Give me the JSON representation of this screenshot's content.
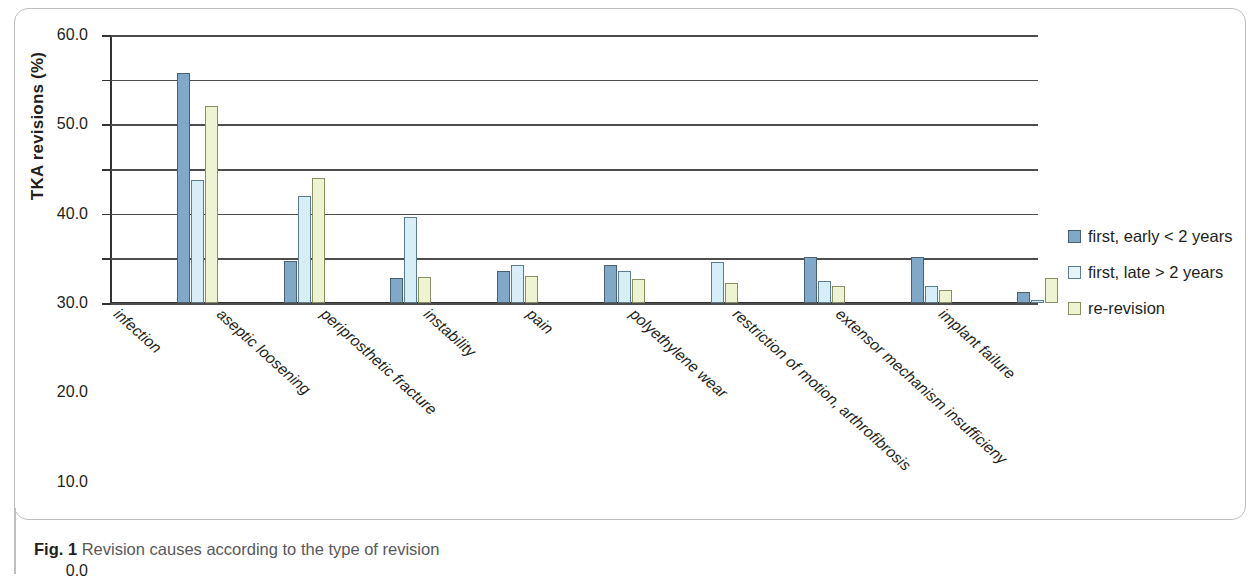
{
  "figure": {
    "caption_label": "Fig. 1",
    "caption_text": " Revision causes according to the type of revision"
  },
  "legend": {
    "position": "right",
    "items": [
      {
        "label": "first, early < 2 years",
        "color": "#7fa8c9",
        "swatch": "series-0-swatch"
      },
      {
        "label": "first, late > 2 years",
        "color": "#e6f4fa",
        "swatch": "series-1-swatch"
      },
      {
        "label": "re-revision",
        "color": "#eef3d2",
        "swatch": "series-2-swatch"
      }
    ]
  },
  "axes": {
    "y_title": "TKA revisions (%)",
    "y_ticks": [
      "60.0",
      "50.0",
      "40.0",
      "30.0",
      "20.0",
      "10.0",
      "0.0"
    ],
    "x_title": ""
  },
  "chart_data": {
    "type": "bar",
    "title": "",
    "subtitle": "",
    "xlabel": "",
    "ylabel": "TKA revisions (%)",
    "ylim": [
      0,
      60
    ],
    "ytick_values": [
      0,
      10,
      20,
      30,
      40,
      50,
      60
    ],
    "grid": true,
    "legend_position": "right",
    "categories": [
      "infection",
      "aseptic loosening",
      "periprosthetic fracture",
      "instability",
      "pain",
      "polyethylene wear",
      "restriction of motion, arthrofibrosis",
      "extensor mechanism insufficieny",
      "implant failure"
    ],
    "series": [
      {
        "name": "first, early < 2 years",
        "color": "#7fa8c9",
        "values": [
          51.5,
          9.5,
          5.7,
          7.2,
          8.6,
          0.0,
          10.2,
          10.3,
          2.4
        ]
      },
      {
        "name": "first, late > 2 years",
        "color": "#e6f4fa",
        "values": [
          27.6,
          23.9,
          19.3,
          8.4,
          7.1,
          9.1,
          5.0,
          3.9,
          0.6
        ]
      },
      {
        "name": "re-revision",
        "color": "#eef3d2",
        "values": [
          44.2,
          28.1,
          5.9,
          6.1,
          5.3,
          4.5,
          3.7,
          2.9,
          5.6
        ]
      }
    ]
  }
}
